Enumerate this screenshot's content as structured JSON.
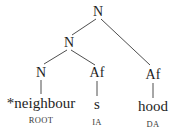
{
  "diagram": {
    "type": "morphological-tree",
    "nodes": {
      "root": {
        "label": "N"
      },
      "inner": {
        "label": "N"
      },
      "base": {
        "label": "N"
      },
      "affix_infl": {
        "label": "Af"
      },
      "affix_deriv": {
        "label": "Af"
      }
    },
    "leaves": {
      "base": {
        "form": "*neighbour",
        "tag": "ROOT"
      },
      "affix_infl": {
        "form": "s",
        "tag": "IA"
      },
      "affix_deriv": {
        "form": "hood",
        "tag": "DA"
      }
    },
    "edges": [
      [
        "root",
        "inner"
      ],
      [
        "root",
        "affix_deriv"
      ],
      [
        "inner",
        "base"
      ],
      [
        "inner",
        "affix_infl"
      ],
      [
        "base",
        "leaf:base"
      ],
      [
        "affix_infl",
        "leaf:affix_infl"
      ],
      [
        "affix_deriv",
        "leaf:affix_deriv"
      ]
    ],
    "colors": {
      "line": "#3a3a3a",
      "text": "#1e1e1e",
      "background": "#ffffff"
    }
  }
}
